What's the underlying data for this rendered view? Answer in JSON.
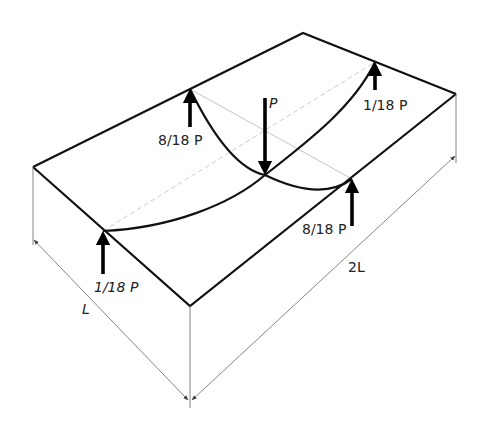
{
  "diagram": {
    "type": "isometric-slab-load-distribution",
    "labels": {
      "center_load": "P",
      "top_left_reaction": "8/18 P",
      "top_right_reaction": "1/18 P",
      "bottom_left_reaction": "1/18 P",
      "bottom_right_reaction": "8/18 P",
      "short_dimension": "L",
      "long_dimension": "2L"
    },
    "colors": {
      "edge": "#111111",
      "force_arrow": "#000000",
      "dimension_line": "#777777",
      "guide_line": "#bdbdbd",
      "background": "#ffffff"
    }
  }
}
